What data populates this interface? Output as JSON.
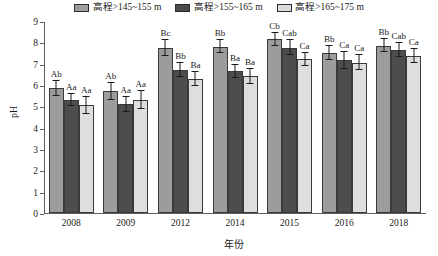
{
  "chart_data": {
    "type": "bar",
    "title": "",
    "xlabel": "年份",
    "ylabel": "pH",
    "ylim": [
      0,
      9
    ],
    "yticks": [
      0,
      1,
      2,
      3,
      4,
      5,
      6,
      7,
      8,
      9
    ],
    "grid": false,
    "legend_position": "top-center",
    "categories": [
      "2008",
      "2009",
      "2012",
      "2014",
      "2015",
      "2016",
      "2018"
    ],
    "series": [
      {
        "name": "高程>145~155 m",
        "color": "#9c9c9c",
        "values": [
          5.85,
          5.7,
          7.75,
          7.8,
          8.15,
          7.5,
          7.85
        ],
        "errors": [
          0.35,
          0.4,
          0.38,
          0.32,
          0.3,
          0.35,
          0.3
        ],
        "letters": [
          "Ab",
          "Ab",
          "Bc",
          "Bb",
          "Cb",
          "Bb",
          "Bb"
        ]
      },
      {
        "name": "高程>155~165 m",
        "color": "#4d4d4d",
        "values": [
          5.3,
          5.1,
          6.7,
          6.65,
          7.75,
          7.15,
          7.65
        ],
        "errors": [
          0.3,
          0.35,
          0.32,
          0.3,
          0.35,
          0.38,
          0.33
        ],
        "letters": [
          "Aa",
          "Aa",
          "Bb",
          "Ba",
          "Cab",
          "Ca",
          "Cab"
        ]
      },
      {
        "name": "高程>165~175 m",
        "color": "#dedede",
        "values": [
          5.05,
          5.3,
          6.3,
          6.4,
          7.2,
          7.05,
          7.35
        ],
        "errors": [
          0.4,
          0.42,
          0.33,
          0.35,
          0.32,
          0.35,
          0.32
        ],
        "letters": [
          "Aa",
          "Aa",
          "Ba",
          "Ba",
          "Ca",
          "Ca",
          "Ca"
        ]
      }
    ]
  }
}
